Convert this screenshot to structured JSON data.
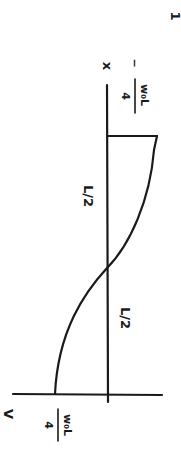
{
  "diagram": {
    "type": "shear-force-diagram",
    "page_number": "1",
    "axes": {
      "vertical_label": "V",
      "horizontal_label": "x"
    },
    "segments": [
      {
        "label": "L/2"
      },
      {
        "label": "L/2"
      }
    ],
    "values": {
      "start": {
        "sign": "",
        "numerator": "w₀L",
        "denominator": "4"
      },
      "end": {
        "sign": "−",
        "numerator": "w₀L",
        "denominator": "4"
      }
    },
    "colors": {
      "ink": "#1a1a1a",
      "background": "#ffffff"
    }
  }
}
